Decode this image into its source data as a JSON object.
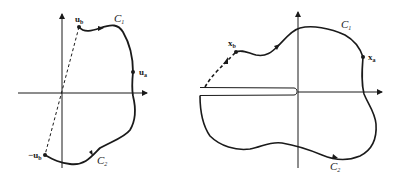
{
  "figure": {
    "left_panel": {
      "contour_upper_label": "C",
      "contour_upper_sub": "1",
      "contour_lower_label": "C",
      "contour_lower_sub": "2",
      "point_ub_label": "u",
      "point_ub_sub": "b",
      "point_ua_label": "u",
      "point_ua_sub": "a",
      "point_neg_ub_label": "−u",
      "point_neg_ub_sub": "b"
    },
    "right_panel": {
      "contour_upper_label": "C",
      "contour_upper_sub": "1",
      "contour_lower_label": "C",
      "contour_lower_sub": "2",
      "point_xb_label": "x",
      "point_xb_sub": "b",
      "point_xa_label": "x",
      "point_xa_sub": "a"
    },
    "colors": {
      "ink": "#1a1a1a",
      "background": "#ffffff"
    }
  }
}
